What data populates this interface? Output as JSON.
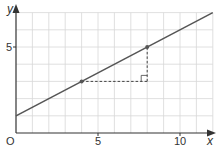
{
  "chart_data": {
    "type": "line",
    "title": "",
    "xlabel": "x",
    "ylabel": "y",
    "origin_label": "O",
    "xlim": [
      0,
      12
    ],
    "ylim": [
      0,
      7
    ],
    "grid": true,
    "x_ticks": [
      {
        "value": 5,
        "label": "5"
      },
      {
        "value": 10,
        "label": "10"
      }
    ],
    "y_ticks": [
      {
        "value": 5,
        "label": "5"
      }
    ],
    "series": [
      {
        "name": "line",
        "equation": "y = 0.5x + 1",
        "x": [
          0,
          12
        ],
        "y": [
          1,
          7
        ]
      }
    ],
    "points": [
      {
        "name": "point-a",
        "x": 4,
        "y": 3
      },
      {
        "name": "point-b",
        "x": 8,
        "y": 5
      }
    ],
    "slope_triangle": {
      "from": [
        4,
        3
      ],
      "corner": [
        8,
        3
      ],
      "to": [
        8,
        5
      ],
      "style": "dashed",
      "right_angle_marker": true
    },
    "colors": {
      "line": "#555555",
      "grid": "#d8d8d8",
      "axis": "#333333",
      "dashed": "#444444"
    }
  }
}
